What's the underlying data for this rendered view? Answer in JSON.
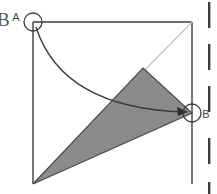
{
  "figure": {
    "background_color": "#ffffff",
    "stroke_color": "#3c3c3c",
    "light_stroke_color": "#b9b9b9",
    "fill_gray": "#8a8c8c",
    "labels": {
      "point_a": "A",
      "point_b": "B",
      "clipped_left_glyph": "B"
    },
    "geometry": {
      "square": {
        "top_left": [
          33,
          22
        ],
        "top_right": [
          192,
          22
        ],
        "bottom_left": [
          33,
          184
        ],
        "bottom_right": [
          192,
          184
        ]
      },
      "diagonal": {
        "from": [
          33,
          184
        ],
        "to": [
          192,
          22
        ],
        "color": "#c4c4c4"
      },
      "shaded_triangle": {
        "vertices": [
          [
            143,
            68
          ],
          [
            192,
            113
          ],
          [
            33,
            184
          ]
        ],
        "fill": "#8a8c8c",
        "stroke": "#4c4c4c"
      },
      "arc_arrow": {
        "from": [
          33,
          22
        ],
        "to": [
          188,
          112
        ],
        "control": [
          60,
          105
        ],
        "color": "#3c3c3c"
      },
      "marker_circles": [
        {
          "name": "circle-a",
          "center": [
            33,
            22
          ],
          "radius": 9
        },
        {
          "name": "circle-b",
          "center": [
            192,
            113
          ],
          "radius": 9
        }
      ]
    },
    "right_edge_marks": {
      "color": "#3c3c3c",
      "x": 209,
      "segments": [
        {
          "y": 2,
          "height": 26
        },
        {
          "y": 44,
          "height": 26
        },
        {
          "y": 86,
          "height": 26
        },
        {
          "y": 138,
          "height": 26
        },
        {
          "y": 182,
          "height": 12
        }
      ]
    }
  }
}
